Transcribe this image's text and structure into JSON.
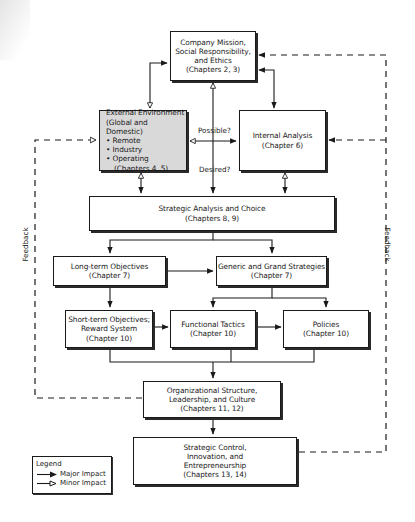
{
  "diagram": {
    "boxes": {
      "mission": {
        "lines": [
          "Company Mission,",
          "Social Responsibility,",
          "and Ethics",
          "(Chapters 2, 3)"
        ]
      },
      "external": {
        "title1": "External Environment",
        "title2": "(Global and Domestic)",
        "bullets": [
          "• Remote",
          "• Industry",
          "• Operating"
        ],
        "chapters": "(Chapters 4, 5)",
        "fill": "#d9d9d9"
      },
      "internal": {
        "lines": [
          "Internal Analysis",
          "(Chapter 6)"
        ]
      },
      "strategic_analysis": {
        "lines": [
          "Strategic Analysis and Choice",
          "(Chapters 8, 9)"
        ]
      },
      "long_term": {
        "lines": [
          "Long-term Objectives",
          "(Chapter 7)"
        ]
      },
      "generic": {
        "lines": [
          "Generic and Grand Strategies",
          "(Chapter 7)"
        ]
      },
      "short_term": {
        "lines": [
          "Short-term Objectives;",
          "Reward System",
          "(Chapter 10)"
        ]
      },
      "functional": {
        "lines": [
          "Functional Tactics",
          "(Chapter 10)"
        ]
      },
      "policies": {
        "lines": [
          "Policies",
          "(Chapter 10)"
        ]
      },
      "org_structure": {
        "lines": [
          "Organizational Structure,",
          "Leadership, and Culture",
          "(Chapters 11, 12)"
        ]
      },
      "control": {
        "lines": [
          "Strategic Control,",
          "Innovation, and",
          "Entrepreneurship",
          "(Chapters 13, 14)"
        ]
      }
    },
    "labels": {
      "possible": "Possible?",
      "desired": "Desired?",
      "feedback_left": "Feedback",
      "feedback_right": "Feedback"
    },
    "legend": {
      "title": "Legend",
      "major": "Major Impact",
      "minor": "Minor Impact"
    }
  }
}
